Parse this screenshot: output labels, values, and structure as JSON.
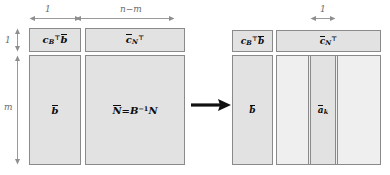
{
  "diagram": {
    "type": "block-matrix-diagram",
    "transition_icon": "right-arrow-icon",
    "colors": {
      "block_fill": "#e2e2e2",
      "block_fill_light": "#efefef",
      "block_border": "#8a8a8a",
      "dimension_text": "#6b6b6b",
      "label_text": "#0d0d0d",
      "arrow": "#111111",
      "background": "#ffffff"
    },
    "left_panel": {
      "name": "initial-tableau",
      "dimensions": {
        "top_width_left": "1",
        "top_width_right": "n−m",
        "side_height_top": "1",
        "side_height_main": "m"
      },
      "blocks": {
        "objective_value": {
          "symbol": "c",
          "subscript": "B",
          "superscript": "⊤",
          "second_symbol": "b",
          "plain": "c_B^T b̄"
        },
        "reduced_costs": {
          "symbol": "c",
          "subscript": "N",
          "superscript": "⊤",
          "plain": "c̄_N^⊤"
        },
        "rhs": {
          "symbol": "b",
          "plain": "b̄"
        },
        "constraint_matrix": {
          "lhs": "N",
          "equals": "=",
          "rhs_symbol": "B",
          "rhs_exponent": "−1",
          "rhs_tail": "N",
          "plain": "N̄ = B⁻¹N"
        }
      }
    },
    "right_panel": {
      "name": "pivot-column-highlighted-tableau",
      "dimensions": {
        "column_width": "1"
      },
      "blocks": {
        "objective_value": {
          "symbol": "c",
          "subscript": "B",
          "superscript": "⊤",
          "second_symbol": "b",
          "plain": "c_B^T b̄"
        },
        "reduced_costs": {
          "symbol": "c",
          "subscript": "N",
          "superscript": "⊤",
          "plain": "c̄_N^⊤"
        },
        "rhs": {
          "symbol": "b",
          "plain": "b̄"
        },
        "pivot_column": {
          "symbol": "a",
          "subscript": "k",
          "plain": "ā_k"
        }
      }
    }
  }
}
